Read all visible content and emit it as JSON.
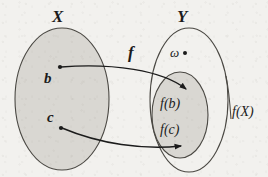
{
  "figure": {
    "kind": "set-mapping-diagram",
    "caption": "",
    "background_color": "#f2f1ee",
    "ink_color": "#1b1b1b",
    "shade_color": "#d9d7d2"
  },
  "sets": {
    "domain": {
      "label": "X",
      "shaded": true,
      "cx": 62,
      "cy": 99,
      "rx": 47,
      "ry": 71
    },
    "codomain": {
      "label": "Y",
      "shaded": false,
      "cx": 189,
      "cy": 100,
      "rx": 39,
      "ry": 72
    },
    "image": {
      "label": "f(X)",
      "shaded": true,
      "cx": 180,
      "cy": 115,
      "rx": 28,
      "ry": 43
    }
  },
  "labels": {
    "set_x": "X",
    "set_y": "Y",
    "map_f": "f",
    "image_set": "f(X)",
    "element_b": "b",
    "element_c": "c",
    "image_b": "f(b)",
    "image_c": "f(c)",
    "omega": "ω"
  },
  "points": [
    {
      "name": "b",
      "label": "b",
      "x": 60,
      "y": 67
    },
    {
      "name": "c",
      "label": "c",
      "x": 61,
      "y": 128
    },
    {
      "name": "omega",
      "label": "ω",
      "x": 185,
      "y": 53
    }
  ],
  "arrows": [
    {
      "name": "arrow-b-to-fb",
      "from": "b",
      "to": "f(b)",
      "start": [
        60,
        67
      ],
      "end": [
        186,
        89
      ],
      "control1": [
        110,
        64
      ],
      "control2": [
        165,
        70
      ]
    },
    {
      "name": "arrow-c-to-fc",
      "from": "c",
      "to": "f(c)",
      "start": [
        61,
        128
      ],
      "end": [
        181,
        146
      ],
      "control1": [
        100,
        143
      ],
      "control2": [
        145,
        149
      ]
    }
  ],
  "leader_lines": [
    {
      "name": "fx-leader",
      "label": "f(X)",
      "from": [
        226,
        78
      ],
      "to": [
        231,
        118
      ]
    }
  ]
}
